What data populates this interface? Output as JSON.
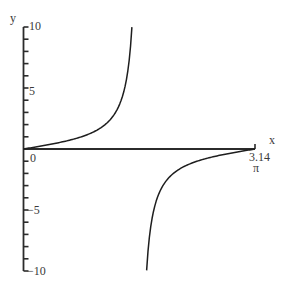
{
  "chart_data": {
    "type": "line",
    "title": "",
    "function": "tan(x)",
    "xlabel": "x",
    "ylabel": "y",
    "xlim": [
      0,
      3.14
    ],
    "ylim": [
      -10,
      10
    ],
    "grid": false,
    "legend": null,
    "x_ticks": [
      {
        "value": 0,
        "label": "0"
      },
      {
        "value": 3.14,
        "label": "3.14",
        "sublabel": "π"
      }
    ],
    "y_ticks": [
      {
        "value": 10,
        "label": "10"
      },
      {
        "value": 5,
        "label": "5"
      },
      {
        "value": -5,
        "label": "−5"
      },
      {
        "value": -10,
        "label": "−10"
      }
    ],
    "y_minor_tick_step": 1,
    "series": [
      {
        "name": "tan(x) branch 1",
        "x": [
          0,
          0.2,
          0.4,
          0.6,
          0.8,
          1.0,
          1.1,
          1.2,
          1.3,
          1.35,
          1.4,
          1.43,
          1.45,
          1.471
        ],
        "y": [
          0,
          0.203,
          0.423,
          0.684,
          1.03,
          1.557,
          1.965,
          2.572,
          3.602,
          4.455,
          5.798,
          7.056,
          8.238,
          10.0
        ]
      },
      {
        "name": "tan(x) branch 2",
        "x": [
          1.671,
          1.692,
          1.712,
          1.742,
          1.792,
          1.842,
          1.942,
          2.042,
          2.142,
          2.342,
          2.542,
          2.742,
          2.942,
          3.142
        ],
        "y": [
          -10.0,
          -8.238,
          -7.056,
          -5.798,
          -4.455,
          -3.602,
          -2.572,
          -1.965,
          -1.557,
          -1.03,
          -0.684,
          -0.423,
          -0.203,
          0
        ]
      }
    ]
  },
  "labels": {
    "x_axis": "x",
    "y_axis": "y",
    "y_10": "10",
    "y_5": "5",
    "origin": "0",
    "y_neg5": "−5",
    "y_neg10": "−10",
    "x_end": "3.14",
    "x_end_symbol": "π"
  }
}
